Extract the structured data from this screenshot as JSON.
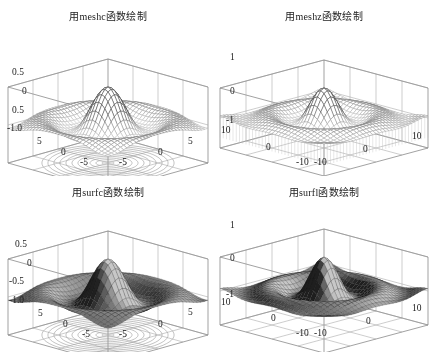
{
  "chart_data": [
    {
      "id": "meshc",
      "type": "mesh3d_with_contour",
      "title": "用meshc函数绘制",
      "function": "z = sin(r)/r, r = sqrt(x^2+y^2)",
      "style": "wireframe mesh with contour lines projected on floor",
      "xlim": [
        -8,
        8
      ],
      "ylim": [
        -8,
        8
      ],
      "zlim": [
        -1.0,
        1.0
      ],
      "zticks": [
        "0.5",
        "0",
        "0.5",
        "-1.0"
      ],
      "xticks": [
        "-5",
        "0",
        "5"
      ],
      "yticks": [
        "5",
        "0",
        "-5"
      ],
      "grid": true
    },
    {
      "id": "meshz",
      "type": "mesh3d_with_curtain",
      "title": "用meshz函数绘制",
      "function": "z = sin(r)/r, r = sqrt(x^2+y^2)",
      "style": "wireframe mesh with curtain (skirt) around edges",
      "xlim": [
        -10,
        10
      ],
      "ylim": [
        -10,
        10
      ],
      "zlim": [
        -1,
        1
      ],
      "zticks": [
        "1",
        "0",
        "-1"
      ],
      "xticks": [
        "-10",
        "0",
        "10"
      ],
      "yticks": [
        "10",
        "0",
        "-10"
      ],
      "grid": true
    },
    {
      "id": "surfc",
      "type": "surface3d_with_contour",
      "title": "用surfc函数绘制",
      "function": "z = sin(r)/r, r = sqrt(x^2+y^2)",
      "style": "shaded surface with contour lines projected on floor",
      "xlim": [
        -8,
        8
      ],
      "ylim": [
        -8,
        8
      ],
      "zlim": [
        -1.0,
        1.0
      ],
      "zticks": [
        "0.5",
        "0",
        "-0.5",
        "-1.0"
      ],
      "xticks": [
        "-5",
        "0",
        "5"
      ],
      "yticks": [
        "5",
        "0",
        "-5"
      ],
      "grid": true
    },
    {
      "id": "surfl",
      "type": "surface3d_lit",
      "title": "用surfl函数绘制",
      "function": "z = sin(r)/r, r = sqrt(x^2+y^2)",
      "style": "lighted surface",
      "xlim": [
        -10,
        10
      ],
      "ylim": [
        -10,
        10
      ],
      "zlim": [
        -1,
        1
      ],
      "zticks": [
        "1",
        "0",
        "-1"
      ],
      "xticks": [
        "-10",
        "0",
        "10"
      ],
      "yticks": [
        "10",
        "0",
        "-10"
      ],
      "grid": true
    }
  ],
  "panels": {
    "meshc": {
      "title": "用meshc函数绘制",
      "z_labels": [
        {
          "text": "0.5",
          "x": 12,
          "y": 68
        },
        {
          "text": "0",
          "x": 22,
          "y": 87
        },
        {
          "text": "0.5",
          "x": 12,
          "y": 106
        },
        {
          "text": "-1.0",
          "x": 7,
          "y": 124
        }
      ],
      "floor_labels": [
        {
          "text": "5",
          "x": 37,
          "y": 137
        },
        {
          "text": "0",
          "x": 61,
          "y": 148
        },
        {
          "text": "-5",
          "x": 80,
          "y": 158
        },
        {
          "text": "-5",
          "x": 119,
          "y": 158
        },
        {
          "text": "0",
          "x": 158,
          "y": 148
        },
        {
          "text": "5",
          "x": 188,
          "y": 137
        }
      ]
    },
    "meshz": {
      "title": "用meshz函数绘制",
      "z_labels": [
        {
          "text": "1",
          "x": 14,
          "y": 53
        },
        {
          "text": "0",
          "x": 14,
          "y": 87
        },
        {
          "text": "-1",
          "x": 10,
          "y": 116
        }
      ],
      "floor_labels": [
        {
          "text": "10",
          "x": 5,
          "y": 126
        },
        {
          "text": "0",
          "x": 50,
          "y": 143
        },
        {
          "text": "-10",
          "x": 80,
          "y": 158
        },
        {
          "text": "-10",
          "x": 98,
          "y": 158
        },
        {
          "text": "0",
          "x": 147,
          "y": 145
        },
        {
          "text": "10",
          "x": 196,
          "y": 132
        }
      ]
    },
    "surfc": {
      "title": "用surfc函数绘制",
      "z_labels": [
        {
          "text": "0.5",
          "x": 15,
          "y": 64
        },
        {
          "text": "0",
          "x": 27,
          "y": 83
        },
        {
          "text": "-0.5",
          "x": 9,
          "y": 101
        },
        {
          "text": "-1.0",
          "x": 9,
          "y": 120
        }
      ],
      "floor_labels": [
        {
          "text": "5",
          "x": 38,
          "y": 133
        },
        {
          "text": "0",
          "x": 63,
          "y": 144
        },
        {
          "text": "-5",
          "x": 82,
          "y": 154
        },
        {
          "text": "-5",
          "x": 119,
          "y": 154
        },
        {
          "text": "0",
          "x": 158,
          "y": 144
        },
        {
          "text": "5",
          "x": 188,
          "y": 132
        }
      ]
    },
    "surfl": {
      "title": "用surfl函数绘制",
      "z_labels": [
        {
          "text": "1",
          "x": 14,
          "y": 45
        },
        {
          "text": "0",
          "x": 14,
          "y": 78
        },
        {
          "text": "-1",
          "x": 10,
          "y": 114
        }
      ],
      "floor_labels": [
        {
          "text": "10",
          "x": 5,
          "y": 122
        },
        {
          "text": "0",
          "x": 55,
          "y": 138
        },
        {
          "text": "-10",
          "x": 80,
          "y": 153
        },
        {
          "text": "-10",
          "x": 98,
          "y": 153
        },
        {
          "text": "0",
          "x": 150,
          "y": 141
        },
        {
          "text": "10",
          "x": 196,
          "y": 128
        }
      ]
    }
  },
  "colors": {
    "axis": "#7a7a7a",
    "mesh_light": "#b0b0b0",
    "mesh_dark": "#333333",
    "surface_dark": "#2a2a2a",
    "surface_light": "#9a9a9a",
    "contour": "#9a9a9a",
    "background": "#ffffff"
  }
}
